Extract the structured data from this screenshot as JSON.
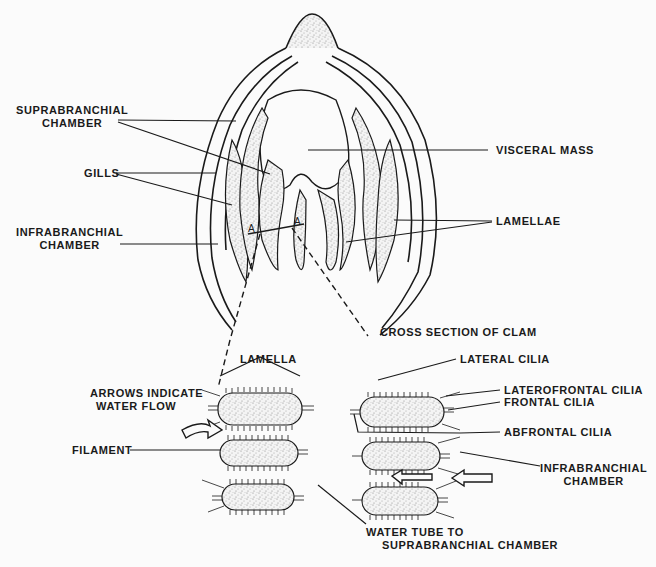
{
  "figure": {
    "colors": {
      "ink": "#1a1a1a",
      "background": "#fbfbfb",
      "stipple": "#bdbdbd"
    }
  },
  "labels": {
    "suprabranchial_chamber_1": "SUPRABRANCHIAL",
    "suprabranchial_chamber_2": "CHAMBER",
    "gills": "GILLS",
    "infrabranchial_chamber_top_1": "INFRABRANCHIAL",
    "infrabranchial_chamber_top_2": "CHAMBER",
    "visceral_mass": "VISCERAL MASS",
    "lamellae": "LAMELLAE",
    "cross_section_caption": "CROSS SECTION OF CLAM",
    "section_marker_a_left": "A",
    "section_marker_a_right": "A",
    "lamella": "LAMELLA",
    "arrows_indicate_1": "ARROWS INDICATE",
    "arrows_indicate_2": "WATER FLOW",
    "filament": "FILAMENT",
    "lateral_cilia": "LATERAL CILIA",
    "laterofrontal_cilia": "LATEROFRONTAL CILIA",
    "frontal_cilia": "FRONTAL CILIA",
    "abfrontal_cilia": "ABFRONTAL CILIA",
    "infrabranchial_chamber_bottom_1": "INFRABRANCHIAL",
    "infrabranchial_chamber_bottom_2": "CHAMBER",
    "water_tube_1": "WATER TUBE TO",
    "water_tube_2": "SUPRABRANCHIAL CHAMBER"
  }
}
